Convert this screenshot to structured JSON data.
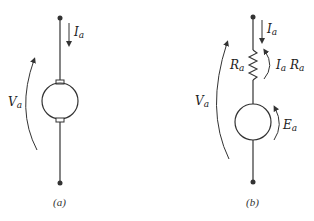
{
  "circuit_a": {
    "caption": "(a)",
    "current_label": {
      "main": "I",
      "sub": "a"
    },
    "voltage_label": {
      "main": "V",
      "sub": "a"
    }
  },
  "circuit_b": {
    "caption": "(b)",
    "current_label": {
      "main": "I",
      "sub": "a"
    },
    "resistor_label": {
      "main": "R",
      "sub": "a"
    },
    "drop_label_1": {
      "main": "I",
      "sub": "a"
    },
    "drop_label_2": {
      "main": "R",
      "sub": "a"
    },
    "emf_label": {
      "main": "E",
      "sub": "a"
    },
    "voltage_label": {
      "main": "V",
      "sub": "a"
    }
  },
  "colors": {
    "line": "#333333",
    "background": "#ffffff"
  }
}
